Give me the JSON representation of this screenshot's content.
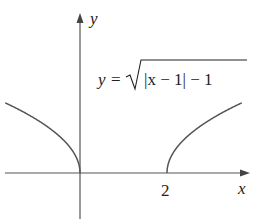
{
  "chart_data": {
    "type": "line",
    "title": "",
    "formula": "y = √(|x − 1| − 1)",
    "formula_parts": {
      "lhs": "y",
      "eq": "=",
      "radicand": "|x − 1| − 1"
    },
    "xlabel": "x",
    "ylabel": "y",
    "x_ticks": [
      {
        "value": 2,
        "label": "2"
      }
    ],
    "xlim": [
      -1.72,
      3.9
    ],
    "ylim": [
      -0.9,
      3.2
    ],
    "grid": false,
    "legend": "none",
    "series": [
      {
        "name": "left branch",
        "domain": [
          -1.72,
          0
        ],
        "x": [
          -1.72,
          -1.5,
          -1.0,
          -0.5,
          -0.25,
          0
        ],
        "y": [
          1.31,
          1.22,
          1.0,
          0.71,
          0.5,
          0
        ]
      },
      {
        "name": "right branch",
        "domain": [
          2,
          3.72
        ],
        "x": [
          2,
          2.25,
          2.5,
          3.0,
          3.5,
          3.72
        ],
        "y": [
          0,
          0.5,
          0.71,
          1.0,
          1.22,
          1.31
        ]
      }
    ],
    "colors": {
      "curve": "#555555",
      "axes": "#555555",
      "text": "#222222"
    }
  }
}
